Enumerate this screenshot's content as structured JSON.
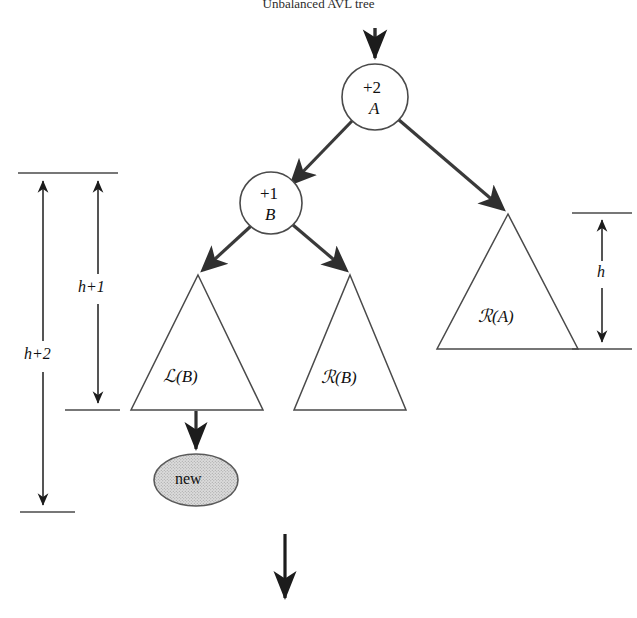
{
  "figure": {
    "caption": "Unbalanced AVL tree",
    "type": "tree-diagram",
    "colors": {
      "stroke": "#3a3a3a",
      "arrow": "#2f2f2f",
      "thin_stroke": "#4a4a4a",
      "new_node_fill": "#d4d4d4",
      "text": "#111111",
      "background": "#ffffff"
    }
  },
  "nodes": [
    {
      "id": "A",
      "balance_factor": "+2",
      "name_label": "A",
      "shape": "circle",
      "cx": 375,
      "cy": 97,
      "r": 33
    },
    {
      "id": "B",
      "balance_factor": "+1",
      "name_label": "B",
      "shape": "circle",
      "cx": 271,
      "cy": 203,
      "r": 31
    }
  ],
  "subtrees": [
    {
      "id": "LB",
      "label_script": "ℒ",
      "label_arg": "(B)",
      "label_full": "ℒ(B)",
      "apex_x": 198,
      "apex_y": 275,
      "base_y": 410,
      "base_left": 131,
      "base_right": 263
    },
    {
      "id": "RB",
      "label_script": "ℛ",
      "label_arg": "(B)",
      "label_full": "ℛ(B)",
      "apex_x": 350,
      "apex_y": 275,
      "base_y": 410,
      "base_left": 294,
      "base_right": 406
    },
    {
      "id": "RA",
      "label_script": "ℛ",
      "label_arg": "(A)",
      "label_full": "ℛ(A)",
      "apex_x": 508,
      "apex_y": 214,
      "base_y": 349,
      "base_left": 437,
      "base_right": 578
    }
  ],
  "new_node": {
    "label": "new",
    "shape": "ellipse",
    "cx": 196,
    "cy": 480,
    "rx": 42,
    "ry": 26,
    "shaded": true
  },
  "edges": [
    {
      "name": "entry-arrow",
      "from": "top",
      "to": "A"
    },
    {
      "name": "edge-a-to-b",
      "from": "A",
      "to": "B"
    },
    {
      "name": "edge-a-to-ra",
      "from": "A",
      "to": "RA"
    },
    {
      "name": "edge-b-to-lb",
      "from": "B",
      "to": "LB"
    },
    {
      "name": "edge-b-to-rb",
      "from": "B",
      "to": "RB"
    },
    {
      "name": "edge-lb-to-new",
      "from": "LB",
      "to": "new"
    },
    {
      "name": "exit-arrow",
      "from": "bottom",
      "to": "below"
    }
  ],
  "dimensions": [
    {
      "id": "h-plus-2",
      "label": "h+2",
      "side": "left",
      "x": 43,
      "top_y": 173,
      "bottom_y": 512,
      "label_x": 24,
      "label_y": 355,
      "tick_top": {
        "x1": 18,
        "x2": 118,
        "y": 173
      },
      "tick_bottom": {
        "x1": 20,
        "x2": 75,
        "y": 512
      }
    },
    {
      "id": "h-plus-1",
      "label": "h+1",
      "side": "left-inner",
      "x": 98,
      "top_y": 173,
      "bottom_y": 410,
      "label_x": 78,
      "label_y": 288,
      "tick_top": {
        "x1": 18,
        "x2": 118,
        "y": 173
      },
      "tick_bottom": {
        "x1": 65,
        "x2": 120,
        "y": 410
      }
    },
    {
      "id": "h",
      "label": "h",
      "side": "right",
      "x": 602,
      "top_y": 213,
      "bottom_y": 349,
      "label_x": 597,
      "label_y": 273,
      "tick_top": {
        "x1": 572,
        "x2": 632,
        "y": 213
      },
      "tick_bottom": {
        "x1": 572,
        "x2": 632,
        "y": 349
      }
    }
  ],
  "arrows": {
    "entry": {
      "x": 375,
      "y_start": 28,
      "y_end": 62
    },
    "exit": {
      "x": 285,
      "y_start": 534,
      "y_end": 604
    }
  }
}
